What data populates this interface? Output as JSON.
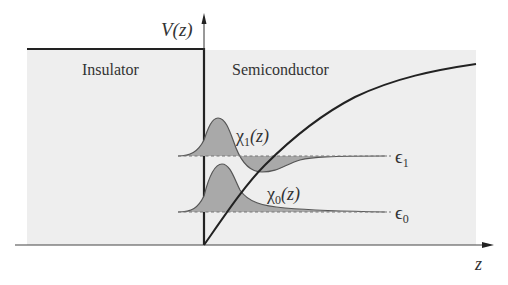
{
  "figure": {
    "regions": {
      "insulator_label": "Insulator",
      "semiconductor_label": "Semiconductor"
    },
    "axes": {
      "y_label": "V(z)",
      "x_label": "z"
    },
    "wavefunctions": {
      "chi1_label_main": "χ",
      "chi1_label_sub": "1",
      "chi1_label_tail": "(z)",
      "chi0_label_main": "χ",
      "chi0_label_sub": "0",
      "chi0_label_tail": "(z)"
    },
    "energy_levels": {
      "e1_main": "ϵ",
      "e1_sub": "1",
      "e0_main": "ϵ",
      "e0_sub": "0"
    },
    "colors": {
      "background_region": "#eeeeee",
      "line": "#222222",
      "fill_wavefunction": "#a9a9a9",
      "dashed_level": "#777777"
    }
  }
}
